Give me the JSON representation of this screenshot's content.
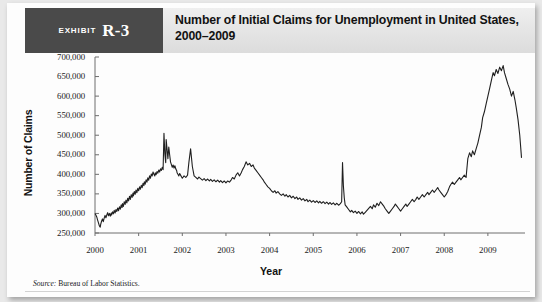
{
  "exhibit": {
    "label": "EXHIBIT",
    "number": "R-3",
    "title": "Number of Initial Claims for Unemployment in United States, 2000–2009"
  },
  "source": {
    "prefix": "Source:",
    "text": "Bureau of Labor Statistics."
  },
  "chart_data": {
    "type": "line",
    "title": "Number of Initial Claims for Unemployment in United States, 2000–2009",
    "xlabel": "Year",
    "ylabel": "Number of Claims",
    "xlim": [
      2000,
      2009.85
    ],
    "ylim": [
      250000,
      700000
    ],
    "yticks": [
      250000,
      300000,
      350000,
      400000,
      450000,
      500000,
      550000,
      600000,
      650000,
      700000
    ],
    "ytick_labels": [
      "250,000",
      "300,000",
      "350,000",
      "400,000",
      "450,000",
      "500,000",
      "550,000",
      "600,000",
      "650,000",
      "700,000"
    ],
    "xticks": [
      2000,
      2001,
      2002,
      2003,
      2004,
      2005,
      2006,
      2007,
      2008,
      2009
    ],
    "xtick_labels": [
      "2000",
      "2001",
      "2002",
      "2003",
      "2004",
      "2005",
      "2006",
      "2007",
      "2008",
      "2009"
    ],
    "grid": false,
    "legend": null,
    "line_color": "#202020",
    "series_name": "Initial claims (weekly, seasonally adjusted)",
    "x": [
      2000.0,
      2000.02,
      2000.04,
      2000.06,
      2000.08,
      2000.1,
      2000.12,
      2000.13,
      2000.15,
      2000.17,
      2000.19,
      2000.21,
      2000.23,
      2000.25,
      2000.27,
      2000.29,
      2000.31,
      2000.33,
      2000.35,
      2000.37,
      2000.38,
      2000.4,
      2000.42,
      2000.44,
      2000.46,
      2000.48,
      2000.5,
      2000.52,
      2000.54,
      2000.56,
      2000.58,
      2000.6,
      2000.62,
      2000.63,
      2000.65,
      2000.67,
      2000.69,
      2000.71,
      2000.73,
      2000.75,
      2000.77,
      2000.79,
      2000.81,
      2000.83,
      2000.85,
      2000.87,
      2000.88,
      2000.9,
      2000.92,
      2000.94,
      2000.96,
      2000.98,
      2001.0,
      2001.02,
      2001.04,
      2001.06,
      2001.08,
      2001.1,
      2001.12,
      2001.13,
      2001.15,
      2001.17,
      2001.19,
      2001.21,
      2001.23,
      2001.25,
      2001.27,
      2001.29,
      2001.31,
      2001.33,
      2001.35,
      2001.37,
      2001.38,
      2001.4,
      2001.42,
      2001.44,
      2001.46,
      2001.48,
      2001.5,
      2001.52,
      2001.54,
      2001.56,
      2001.58,
      2001.6,
      2001.62,
      2001.63,
      2001.65,
      2001.67,
      2001.69,
      2001.71,
      2001.73,
      2001.75,
      2001.77,
      2001.79,
      2001.81,
      2001.83,
      2001.85,
      2001.87,
      2001.88,
      2001.9,
      2001.92,
      2001.94,
      2001.96,
      2001.98,
      2002.0,
      2002.04,
      2002.08,
      2002.12,
      2002.15,
      2002.19,
      2002.23,
      2002.27,
      2002.31,
      2002.35,
      2002.38,
      2002.42,
      2002.46,
      2002.5,
      2002.54,
      2002.58,
      2002.62,
      2002.65,
      2002.69,
      2002.73,
      2002.77,
      2002.81,
      2002.85,
      2002.88,
      2002.92,
      2002.96,
      2003.0,
      2003.04,
      2003.08,
      2003.12,
      2003.15,
      2003.19,
      2003.23,
      2003.27,
      2003.31,
      2003.35,
      2003.38,
      2003.42,
      2003.46,
      2003.5,
      2003.54,
      2003.58,
      2003.62,
      2003.65,
      2003.69,
      2003.73,
      2003.77,
      2003.81,
      2003.85,
      2003.88,
      2003.92,
      2003.96,
      2004.0,
      2004.04,
      2004.08,
      2004.12,
      2004.15,
      2004.19,
      2004.23,
      2004.27,
      2004.31,
      2004.35,
      2004.38,
      2004.42,
      2004.46,
      2004.5,
      2004.54,
      2004.58,
      2004.62,
      2004.65,
      2004.69,
      2004.73,
      2004.77,
      2004.81,
      2004.85,
      2004.88,
      2004.92,
      2004.96,
      2005.0,
      2005.04,
      2005.08,
      2005.12,
      2005.15,
      2005.19,
      2005.23,
      2005.27,
      2005.31,
      2005.35,
      2005.38,
      2005.42,
      2005.46,
      2005.5,
      2005.54,
      2005.58,
      2005.62,
      2005.65,
      2005.67,
      2005.69,
      2005.71,
      2005.73,
      2005.77,
      2005.81,
      2005.85,
      2005.88,
      2005.92,
      2005.96,
      2006.0,
      2006.04,
      2006.08,
      2006.12,
      2006.15,
      2006.19,
      2006.23,
      2006.27,
      2006.31,
      2006.35,
      2006.38,
      2006.42,
      2006.46,
      2006.5,
      2006.54,
      2006.58,
      2006.62,
      2006.65,
      2006.69,
      2006.73,
      2006.77,
      2006.81,
      2006.85,
      2006.88,
      2006.92,
      2006.96,
      2007.0,
      2007.04,
      2007.08,
      2007.12,
      2007.15,
      2007.19,
      2007.23,
      2007.27,
      2007.31,
      2007.35,
      2007.38,
      2007.42,
      2007.46,
      2007.5,
      2007.54,
      2007.58,
      2007.62,
      2007.65,
      2007.69,
      2007.73,
      2007.77,
      2007.81,
      2007.85,
      2007.88,
      2007.92,
      2007.96,
      2008.0,
      2008.04,
      2008.08,
      2008.12,
      2008.15,
      2008.19,
      2008.23,
      2008.27,
      2008.31,
      2008.35,
      2008.38,
      2008.42,
      2008.46,
      2008.5,
      2008.54,
      2008.58,
      2008.62,
      2008.65,
      2008.69,
      2008.73,
      2008.77,
      2008.81,
      2008.85,
      2008.88,
      2008.92,
      2008.96,
      2009.0,
      2009.04,
      2009.08,
      2009.12,
      2009.15,
      2009.19,
      2009.23,
      2009.27,
      2009.31,
      2009.35,
      2009.38,
      2009.42,
      2009.46,
      2009.5,
      2009.54,
      2009.58,
      2009.62,
      2009.65,
      2009.69,
      2009.73,
      2009.77
    ],
    "y": [
      300000,
      296000,
      291000,
      283000,
      276000,
      268000,
      265000,
      272000,
      280000,
      286000,
      279000,
      288000,
      295000,
      289000,
      296000,
      302000,
      294000,
      300000,
      293000,
      301000,
      296000,
      304000,
      299000,
      308000,
      301000,
      310000,
      305000,
      314000,
      307000,
      317000,
      311000,
      322000,
      315000,
      325000,
      318000,
      330000,
      323000,
      334000,
      327000,
      339000,
      332000,
      344000,
      336000,
      348000,
      341000,
      352000,
      345000,
      356000,
      349000,
      360000,
      353000,
      364000,
      358000,
      368000,
      362000,
      372000,
      366000,
      377000,
      371000,
      381000,
      375000,
      386000,
      380000,
      391000,
      385000,
      396000,
      390000,
      401000,
      396000,
      406000,
      400000,
      396000,
      404000,
      399000,
      407000,
      403000,
      411000,
      406000,
      414000,
      410000,
      418000,
      412000,
      505000,
      452000,
      430000,
      489000,
      465000,
      440000,
      470000,
      450000,
      432000,
      425000,
      418000,
      424000,
      416000,
      422000,
      414000,
      410000,
      404000,
      400000,
      396000,
      402000,
      398000,
      394000,
      390000,
      396000,
      392000,
      398000,
      430000,
      465000,
      420000,
      396000,
      392000,
      388000,
      393000,
      389000,
      385000,
      389000,
      384000,
      388000,
      383000,
      387000,
      382000,
      386000,
      381000,
      385000,
      380000,
      384000,
      379000,
      383000,
      378000,
      383000,
      380000,
      386000,
      392000,
      388000,
      398000,
      404000,
      396000,
      404000,
      412000,
      420000,
      432000,
      424000,
      428000,
      420000,
      424000,
      416000,
      410000,
      404000,
      398000,
      392000,
      386000,
      380000,
      374000,
      368000,
      364000,
      358000,
      354000,
      358000,
      352000,
      356000,
      350000,
      346000,
      350000,
      344000,
      348000,
      342000,
      346000,
      340000,
      344000,
      338000,
      342000,
      336000,
      340000,
      334000,
      338000,
      332000,
      336000,
      330000,
      334000,
      329000,
      333000,
      328000,
      332000,
      327000,
      331000,
      326000,
      330000,
      325000,
      329000,
      324000,
      328000,
      323000,
      327000,
      322000,
      326000,
      321000,
      325000,
      330000,
      430000,
      370000,
      340000,
      322000,
      316000,
      310000,
      304000,
      308000,
      302000,
      306000,
      300000,
      305000,
      299000,
      304000,
      298000,
      303000,
      308000,
      313000,
      318000,
      312000,
      322000,
      316000,
      326000,
      320000,
      330000,
      324000,
      318000,
      312000,
      306000,
      300000,
      306000,
      312000,
      318000,
      324000,
      318000,
      312000,
      306000,
      312000,
      318000,
      324000,
      318000,
      324000,
      330000,
      336000,
      330000,
      336000,
      342000,
      336000,
      342000,
      348000,
      342000,
      348000,
      354000,
      348000,
      354000,
      360000,
      354000,
      360000,
      366000,
      360000,
      354000,
      348000,
      342000,
      348000,
      356000,
      368000,
      374000,
      380000,
      374000,
      380000,
      386000,
      392000,
      386000,
      392000,
      398000,
      392000,
      440000,
      455000,
      445000,
      460000,
      450000,
      465000,
      480000,
      500000,
      520000,
      545000,
      560000,
      580000,
      600000,
      620000,
      640000,
      660000,
      652000,
      668000,
      658000,
      674000,
      665000,
      678000,
      660000,
      645000,
      630000,
      618000,
      600000,
      612000,
      590000,
      570000,
      540000,
      500000,
      442000
    ]
  }
}
